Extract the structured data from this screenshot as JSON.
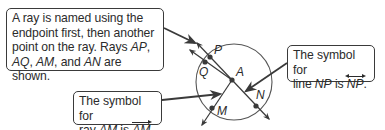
{
  "callouts": {
    "ray_naming": {
      "line1": "A ray is named using the",
      "line2": "endpoint first, then another",
      "line3_prefix": "point on the ray. Rays ",
      "line3_ap": "AP",
      "line3_suffix": ",",
      "line4_aq": "AQ",
      "line4_sep1": ", ",
      "line4_am": "AM",
      "line4_sep2": ", and ",
      "line4_an": "AN",
      "line4_suffix": " are shown."
    },
    "ray_symbol": {
      "line1": "The symbol for",
      "line2_prefix": "ray ",
      "line2_name": "AM",
      "line2_mid": " is ",
      "line2_symbol": "AM",
      "line2_suffix": "."
    },
    "line_symbol": {
      "line1": "The symbol for",
      "line2_prefix": "line ",
      "line2_name": "NP",
      "line2_mid": " is ",
      "line2_symbol": "NP",
      "line2_suffix": "."
    }
  },
  "diagram": {
    "points": {
      "A": "A",
      "P": "P",
      "Q": "Q",
      "M": "M",
      "N": "N"
    },
    "stroke_color": "#3a3a3a",
    "point_color": "#3a3a3a"
  }
}
